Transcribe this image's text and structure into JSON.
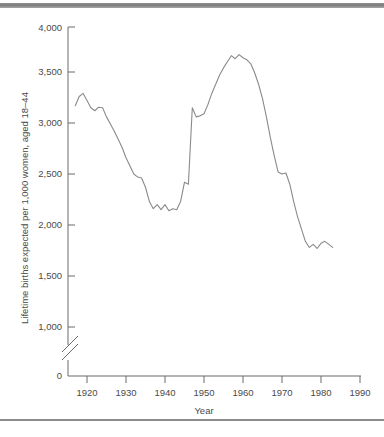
{
  "figure": {
    "top_rule_color": "#7c7c7c",
    "bottom_rule_color": "#8d8d8d",
    "line_color": "#8a8a8a",
    "axis_color": "#6b6b6b"
  },
  "chart_data": {
    "type": "line",
    "title": "",
    "xlabel": "Year",
    "ylabel": "Lifetime births expected per 1,000 women, aged 18–44",
    "xlim": [
      1915,
      1990
    ],
    "ylim": [
      0,
      4000
    ],
    "y_axis_break": {
      "present": true,
      "between": [
        0,
        1000
      ],
      "style": "double-slash"
    },
    "grid": false,
    "legend": null,
    "x_ticks": [
      1920,
      1930,
      1940,
      1950,
      1960,
      1970,
      1980,
      1990
    ],
    "x_tick_labels": [
      "1920",
      "1930",
      "1940",
      "1950",
      "1960",
      "1970",
      "1980",
      "1990"
    ],
    "y_ticks": [
      0,
      1000,
      1500,
      2000,
      2500,
      3000,
      3500,
      4000
    ],
    "y_tick_labels": [
      "0",
      "1,000",
      "1,500",
      "2,000",
      "2,500",
      "3,000",
      "3,500",
      "4,000"
    ],
    "x": [
      1917,
      1918,
      1919,
      1920,
      1921,
      1922,
      1923,
      1924,
      1925,
      1926,
      1927,
      1928,
      1929,
      1930,
      1931,
      1932,
      1933,
      1934,
      1935,
      1936,
      1937,
      1938,
      1939,
      1940,
      1941,
      1942,
      1943,
      1944,
      1945,
      1946,
      1947,
      1948,
      1949,
      1950,
      1951,
      1952,
      1953,
      1954,
      1955,
      1956,
      1957,
      1958,
      1959,
      1960,
      1961,
      1962,
      1963,
      1964,
      1965,
      1966,
      1967,
      1968,
      1969,
      1970,
      1971,
      1972,
      1973,
      1974,
      1975,
      1976,
      1977,
      1978,
      1979,
      1980,
      1981,
      1982,
      1983
    ],
    "values": [
      3170,
      3260,
      3290,
      3220,
      3150,
      3120,
      3155,
      3150,
      3060,
      2990,
      2920,
      2840,
      2760,
      2660,
      2580,
      2500,
      2470,
      2460,
      2370,
      2230,
      2160,
      2200,
      2150,
      2200,
      2140,
      2160,
      2150,
      2230,
      2420,
      2400,
      3150,
      3060,
      3070,
      3090,
      3180,
      3290,
      3380,
      3470,
      3540,
      3600,
      3660,
      3630,
      3670,
      3640,
      3620,
      3580,
      3490,
      3380,
      3240,
      3060,
      2860,
      2680,
      2520,
      2500,
      2510,
      2400,
      2230,
      2080,
      1960,
      1840,
      1780,
      1810,
      1770,
      1820,
      1840,
      1810,
      1780
    ],
    "series_name": "Lifetime births expected per 1,000 women, aged 18-44"
  }
}
